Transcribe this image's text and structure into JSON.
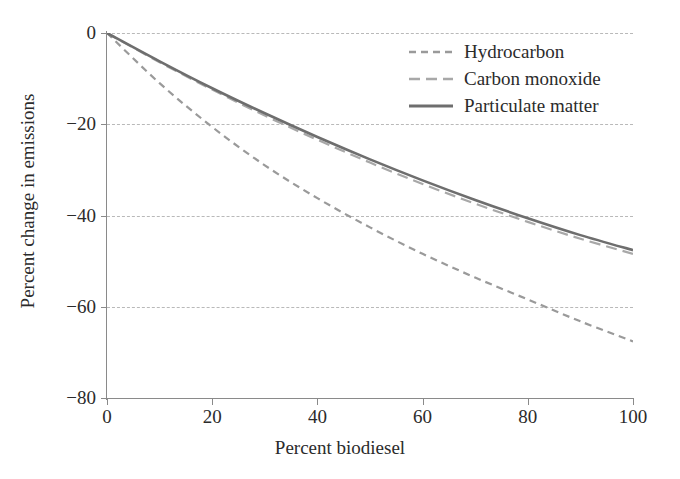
{
  "chart_data": {
    "type": "line",
    "title": "",
    "xlabel": "Percent biodiesel",
    "ylabel": "Percent change in emissions",
    "xlim": [
      0,
      100
    ],
    "ylim": [
      -80,
      0
    ],
    "xticks": [
      0,
      20,
      40,
      60,
      80,
      100
    ],
    "yticks": [
      0,
      -20,
      -40,
      -60,
      -80
    ],
    "xtick_labels": [
      "0",
      "20",
      "40",
      "60",
      "80",
      "100"
    ],
    "ytick_labels": [
      "0",
      "−20",
      "−40",
      "−60",
      "−80"
    ],
    "grid": "horizontal-dashed",
    "legend_position": "top-right",
    "x": [
      0,
      10,
      20,
      30,
      40,
      50,
      60,
      70,
      80,
      90,
      100
    ],
    "series": [
      {
        "name": "Hydrocarbon",
        "style": "dashed-short",
        "color": "#9a9a9a",
        "values": [
          0,
          -11.0,
          -20.6,
          -29.0,
          -36.2,
          -42.6,
          -48.4,
          -53.6,
          -58.4,
          -63.2,
          -67.6
        ]
      },
      {
        "name": "Carbon monoxide",
        "style": "dashed-long",
        "color": "#a8a8a8",
        "values": [
          0,
          -6.4,
          -12.4,
          -18.1,
          -23.4,
          -28.4,
          -33.1,
          -37.4,
          -41.4,
          -45.1,
          -48.4
        ]
      },
      {
        "name": "Particulate matter",
        "style": "solid",
        "color": "#6e6e6e",
        "values": [
          0,
          -6.2,
          -12.1,
          -17.6,
          -22.8,
          -27.7,
          -32.3,
          -36.6,
          -40.6,
          -44.3,
          -47.6
        ]
      }
    ]
  },
  "axes": {
    "xlabel": "Percent biodiesel",
    "ylabel": "Percent change in emissions"
  },
  "legend": {
    "items": [
      {
        "label": "Hydrocarbon"
      },
      {
        "label": "Carbon monoxide"
      },
      {
        "label": "Particulate matter"
      }
    ]
  },
  "colors": {
    "background": "#ffffff",
    "text": "#2b2b2b",
    "axis": "#8a8a8a",
    "grid": "#b9b9b9",
    "hydrocarbon": "#9a9a9a",
    "carbon_monoxide": "#a8a8a8",
    "particulate_matter": "#6e6e6e"
  }
}
